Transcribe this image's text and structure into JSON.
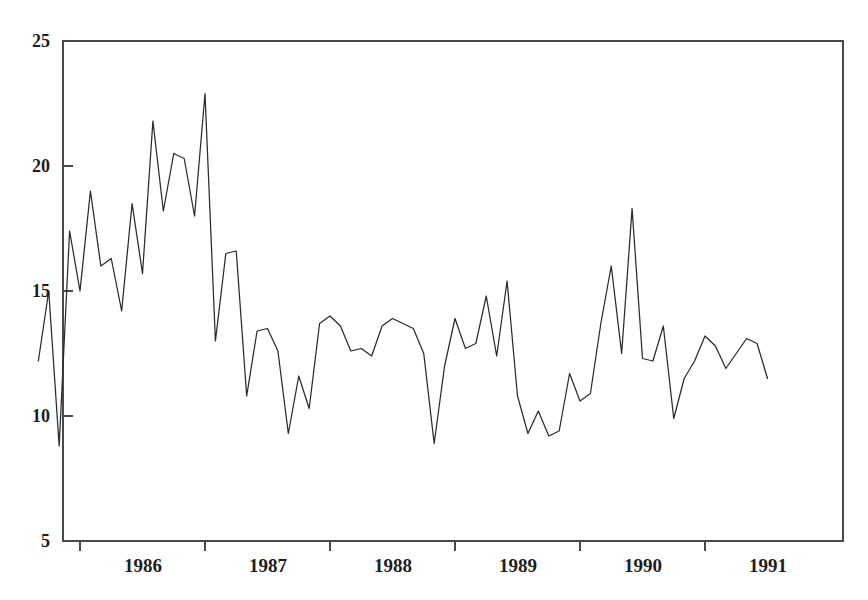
{
  "chart_data": {
    "type": "line",
    "title": "",
    "subtitle": "",
    "xlabel": "",
    "ylabel": "",
    "grid": false,
    "legend": "none",
    "ylim": [
      5,
      25
    ],
    "yticks": [
      5,
      10,
      15,
      20,
      25
    ],
    "ytick_labels": [
      "5",
      "10",
      "15",
      "20",
      "25"
    ],
    "xtick_labels": [
      "1986",
      "1987",
      "1988",
      "1989",
      "1990",
      "1991"
    ],
    "xtick_boundaries": [
      "1986-01",
      "1987-01",
      "1988-01",
      "1989-01",
      "1990-01",
      "1991-01"
    ],
    "x_start": "1985-09",
    "x_end": "1991-07",
    "x_period": "monthly",
    "series": [
      {
        "name": "series-1",
        "color": "#2b2b2b",
        "x": [
          "1985-09",
          "1985-10",
          "1985-11",
          "1985-12",
          "1986-01",
          "1986-02",
          "1986-03",
          "1986-04",
          "1986-05",
          "1986-06",
          "1986-07",
          "1986-08",
          "1986-09",
          "1986-10",
          "1986-11",
          "1986-12",
          "1987-01",
          "1987-02",
          "1987-03",
          "1987-04",
          "1987-05",
          "1987-06",
          "1987-07",
          "1987-08",
          "1987-09",
          "1987-10",
          "1987-11",
          "1987-12",
          "1988-01",
          "1988-02",
          "1988-03",
          "1988-04",
          "1988-05",
          "1988-06",
          "1988-07",
          "1988-08",
          "1988-09",
          "1988-10",
          "1988-11",
          "1988-12",
          "1989-01",
          "1989-02",
          "1989-03",
          "1989-04",
          "1989-05",
          "1989-06",
          "1989-07",
          "1989-08",
          "1989-09",
          "1989-10",
          "1989-11",
          "1989-12",
          "1990-01",
          "1990-02",
          "1990-03",
          "1990-04",
          "1990-05",
          "1990-06",
          "1990-07",
          "1990-08",
          "1990-09",
          "1990-10",
          "1990-11",
          "1990-12",
          "1991-01",
          "1991-02",
          "1991-03",
          "1991-04",
          "1991-05",
          "1991-06",
          "1991-07"
        ],
        "values": [
          12.2,
          15.0,
          8.8,
          17.4,
          15.0,
          19.0,
          16.0,
          16.3,
          14.2,
          18.5,
          15.7,
          21.8,
          18.2,
          20.5,
          20.3,
          18.0,
          22.9,
          13.0,
          16.5,
          16.6,
          10.8,
          13.4,
          13.5,
          12.6,
          9.3,
          11.6,
          10.3,
          13.7,
          14.0,
          13.6,
          12.6,
          12.7,
          12.4,
          13.6,
          13.9,
          13.7,
          13.5,
          12.5,
          8.9,
          12.0,
          13.9,
          12.7,
          12.9,
          14.8,
          12.4,
          15.4,
          10.8,
          9.3,
          10.2,
          9.2,
          9.4,
          11.7,
          10.6,
          10.9,
          13.7,
          16.0,
          12.5,
          18.3,
          12.3,
          12.2,
          13.6,
          9.9,
          11.5,
          12.2,
          13.2,
          12.8,
          11.9,
          12.5,
          13.1,
          12.9,
          11.5
        ]
      }
    ]
  },
  "axes": {
    "y_tick_values": [
      "25",
      "20",
      "15",
      "10",
      "5"
    ],
    "x_tick_values": [
      "1986",
      "1987",
      "1988",
      "1989",
      "1990",
      "1991"
    ]
  }
}
